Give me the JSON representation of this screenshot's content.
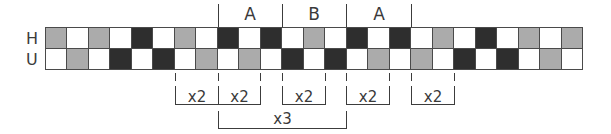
{
  "diagram": {
    "row_labels": {
      "h": "H",
      "u": "U"
    },
    "colors": {
      "white": "#ffffff",
      "gray": "#ababab",
      "black": "#2e2e2e",
      "line": "#3c3c3c"
    },
    "rows": {
      "h": [
        "g",
        "w",
        "g",
        "w",
        "b",
        "w",
        "g",
        "w",
        "b",
        "w",
        "b",
        "w",
        "g",
        "w",
        "b",
        "w",
        "b",
        "w",
        "g",
        "w",
        "b",
        "w",
        "g",
        "w",
        "g"
      ],
      "u": [
        "w",
        "g",
        "w",
        "b",
        "w",
        "b",
        "w",
        "g",
        "w",
        "g",
        "w",
        "b",
        "w",
        "b",
        "w",
        "g",
        "w",
        "g",
        "w",
        "b",
        "w",
        "b",
        "w",
        "g",
        "w"
      ]
    },
    "section_labels": [
      "A",
      "B",
      "A"
    ],
    "repeat_labels": {
      "r1": "x2",
      "r2": "x2",
      "r3": "x2",
      "r4": "x2",
      "r5": "x2",
      "outer": "x3"
    }
  }
}
